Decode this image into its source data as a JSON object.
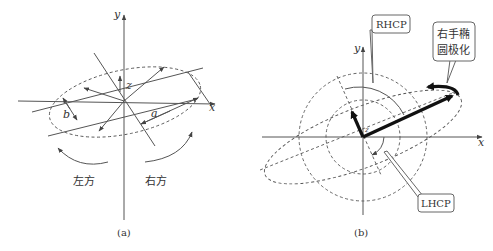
{
  "figure": {
    "panels": [
      {
        "id": "a",
        "caption": "(a)",
        "axes": {
          "x_label": "x",
          "y_label": "y",
          "z_label": "z"
        },
        "dimension_labels": {
          "major": "a",
          "minor": "b"
        },
        "rotation_labels": {
          "left": "左方",
          "right": "右方"
        }
      },
      {
        "id": "b",
        "caption": "(b)",
        "axes": {
          "x_label": "x",
          "y_label": "y",
          "z_label": "z"
        },
        "callouts": {
          "rhcp": "RHCP",
          "lhcp": "LHCP",
          "right_hand_line1": "右手椭",
          "right_hand_line2": "圆极化"
        }
      }
    ]
  }
}
